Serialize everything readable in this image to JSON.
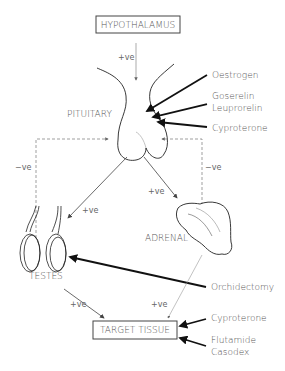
{
  "diagram": {
    "nodes": {
      "hypothalamus": "HYPOTHALAMUS",
      "pituitary": "PITUITARY",
      "testes": "TESTES",
      "adrenal": "ADRENAL",
      "target_tissue": "TARGET TISSUE"
    },
    "edges": {
      "hypothalamus_pituitary": "+ve",
      "pituitary_testes": "+ve",
      "pituitary_adrenal": "+ve",
      "testes_feedback": "−ve",
      "adrenal_feedback": "−ve",
      "testes_target": "+ve",
      "adrenal_target": "+ve"
    },
    "interventions": {
      "oestrogen": "Oestrogen",
      "goserelin": "Goserelin",
      "leuprorelin": "Leuprorelin",
      "cyproterone_pituitary": "Cyproterone",
      "orchidectomy": "Orchidectomy",
      "cyproterone_target": "Cyproterone",
      "flutamide": "Flutamide",
      "casodex": "Casodex"
    }
  }
}
